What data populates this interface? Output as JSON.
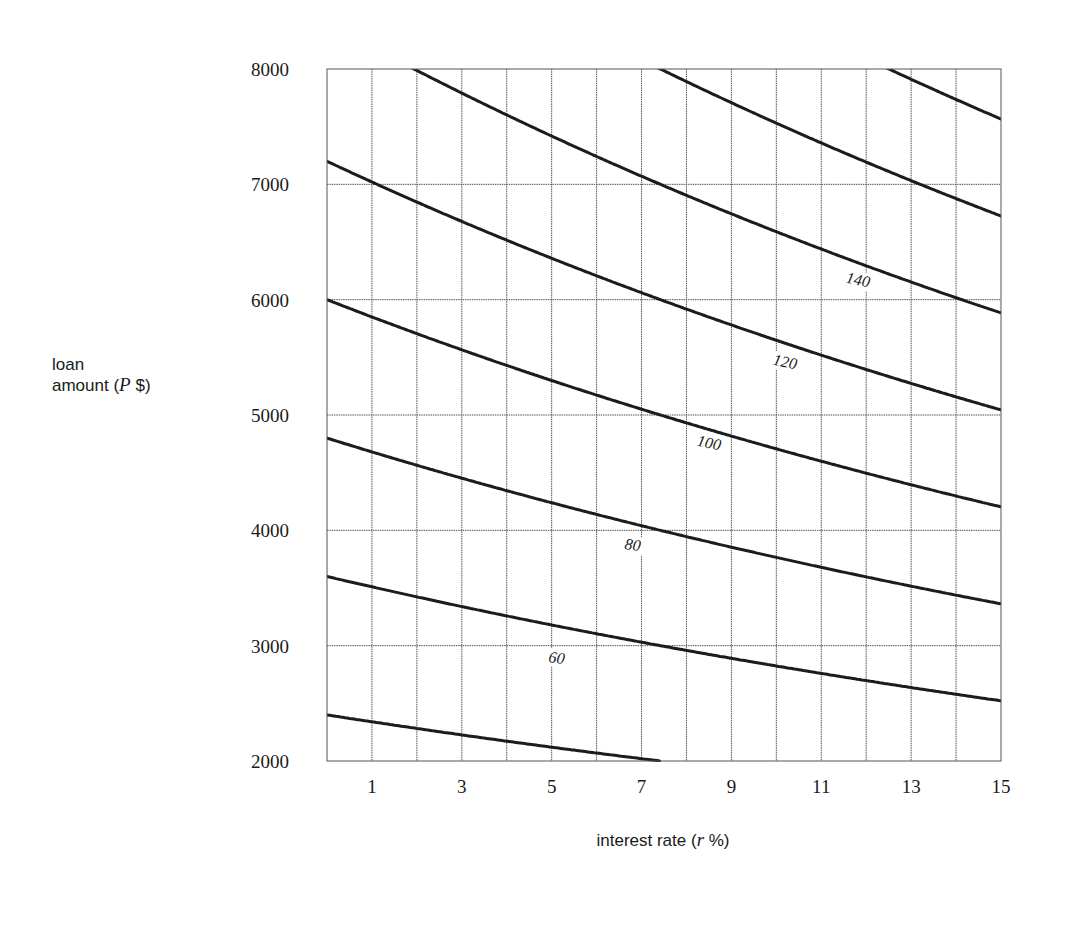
{
  "chart_data": {
    "type": "line",
    "title": "",
    "xlabel": "interest rate (r %)",
    "ylabel": "loan amount (P $)",
    "xlabel_parts": {
      "pre": "interest rate (",
      "var": "r",
      "post": " %)"
    },
    "ylabel_parts": {
      "line1": "loan",
      "pre": "amount (",
      "var": "P",
      "post": " $)"
    },
    "xlim": [
      0,
      15
    ],
    "ylim": [
      2000,
      8000
    ],
    "x_ticks": [
      1,
      3,
      5,
      7,
      9,
      11,
      13,
      15
    ],
    "y_ticks": [
      2000,
      3000,
      4000,
      5000,
      6000,
      7000,
      8000
    ],
    "grid": {
      "x_step": 1,
      "y_step": 1000
    },
    "legend": "none (contour labels placed on curves)",
    "x": [
      0,
      1,
      2,
      3,
      4,
      5,
      6,
      7,
      8,
      9,
      10,
      11,
      12,
      13,
      14,
      15
    ],
    "series": [
      {
        "name": "40",
        "label": "",
        "values": [
          2400,
          2341,
          2282,
          2226,
          2172,
          2120,
          2069,
          2020,
          1973,
          1927,
          1883,
          1840,
          1798,
          1758,
          1719,
          1681
        ]
      },
      {
        "name": "60",
        "label": "60",
        "values": [
          3600,
          3512,
          3423,
          3339,
          3258,
          3179,
          3104,
          3030,
          2959,
          2890,
          2824,
          2759,
          2698,
          2637,
          2579,
          2522
        ],
        "label_pos": {
          "x": 556,
          "y": 663,
          "rot": 8
        }
      },
      {
        "name": "80",
        "label": "80",
        "values": [
          4800,
          4682,
          4564,
          4452,
          4344,
          4239,
          4138,
          4040,
          3946,
          3854,
          3766,
          3679,
          3597,
          3516,
          3438,
          3362
        ],
        "label_pos": {
          "x": 632,
          "y": 550,
          "rot": 8
        }
      },
      {
        "name": "100",
        "label": "100",
        "values": [
          6000,
          5853,
          5705,
          5565,
          5430,
          5299,
          5173,
          5050,
          4932,
          4817,
          4707,
          4599,
          4496,
          4395,
          4298,
          4203
        ],
        "label_pos": {
          "x": 708,
          "y": 448,
          "rot": 12
        }
      },
      {
        "name": "120",
        "label": "120",
        "values": [
          7200,
          7024,
          6846,
          6678,
          6516,
          6359,
          6208,
          6060,
          5918,
          5780,
          5648,
          5519,
          5395,
          5274,
          5158,
          5044
        ],
        "label_pos": {
          "x": 784,
          "y": 367,
          "rot": 12
        }
      },
      {
        "name": "140",
        "label": "140",
        "values": [
          8400,
          8194,
          7987,
          7791,
          7602,
          7419,
          7242,
          7070,
          6905,
          6744,
          6590,
          6439,
          6294,
          6153,
          6017,
          5884
        ],
        "label_pos": {
          "x": 857,
          "y": 285,
          "rot": 12
        }
      },
      {
        "name": "160",
        "label": "",
        "values": [
          9600,
          9365,
          9128,
          8904,
          8688,
          8478,
          8277,
          8080,
          7891,
          7707,
          7531,
          7358,
          7194,
          7032,
          6877,
          6725
        ]
      },
      {
        "name": "180",
        "label": "",
        "values": [
          10800,
          10535,
          10269,
          10017,
          9774,
          9538,
          9311,
          9090,
          8878,
          8671,
          8473,
          8278,
          8093,
          7911,
          7736,
          7565
        ]
      }
    ]
  },
  "plot_box": {
    "left": 327,
    "top": 69,
    "right": 1001,
    "bottom": 761
  },
  "colors": {
    "curve": "#1c1c1c",
    "grid": "#555555",
    "text": "#1a1a1a",
    "background": "#ffffff"
  }
}
